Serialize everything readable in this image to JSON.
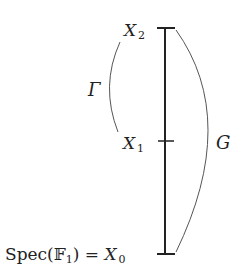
{
  "diagram": {
    "type": "filtration",
    "levels": [
      {
        "id": "X2",
        "base": "X",
        "sub": "2",
        "prefix": ""
      },
      {
        "id": "X1",
        "base": "X",
        "sub": "1",
        "prefix": ""
      },
      {
        "id": "X0",
        "base": "X",
        "sub": "0",
        "prefix": "Spec(𝔽",
        "prefix_sub": "1",
        "prefix_close": ") = "
      }
    ],
    "braces": [
      {
        "id": "gamma",
        "label": "Γ",
        "from": "X1",
        "to": "X2",
        "side": "left"
      },
      {
        "id": "G",
        "label": "G",
        "from": "X0",
        "to": "X2",
        "side": "right"
      }
    ],
    "colors": {
      "line": "#222222",
      "arc": "#555555",
      "text": "#222222"
    }
  }
}
